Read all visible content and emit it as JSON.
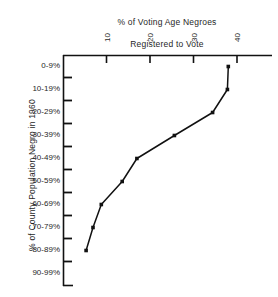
{
  "chart_data": {
    "type": "line",
    "title": "% of Voting Age Negroes Registered to Vote",
    "title_lines": [
      "% of Voting Age Negroes",
      "Registered to Vote"
    ],
    "xlabel": "% of Voting Age Negroes Registered to Vote",
    "ylabel": "% of County Population Negro in 1960",
    "categories": [
      "0-9%",
      "10-19%",
      "20-29%",
      "30-39%",
      "40-49%",
      "50-59%",
      "60-69%",
      "70-79%",
      "80-89%",
      "90-99%"
    ],
    "values": [
      38,
      37.8,
      34.4,
      25.6,
      17,
      13.6,
      8.8,
      6.9,
      5.3,
      null
    ],
    "xticks": [
      10,
      20,
      30,
      40
    ],
    "xlim": [
      0,
      44
    ],
    "ylim_categories": 10,
    "grid": false,
    "legend": false,
    "x_axis_position": "top",
    "marker": "filled-square",
    "line_color": "#111111",
    "axis_color": "#111111"
  },
  "axis": {
    "x_tick_labels": [
      "10",
      "20",
      "30",
      "40"
    ],
    "y_tick_labels": [
      "0-9%",
      "10-19%",
      "20-29%",
      "30-39%",
      "40-49%",
      "50-59%",
      "60-69%",
      "70-79%",
      "80-89%",
      "90-99%"
    ]
  },
  "colors": {
    "background": "#ffffff",
    "ink": "#111111",
    "text": "#1f1f1f"
  }
}
